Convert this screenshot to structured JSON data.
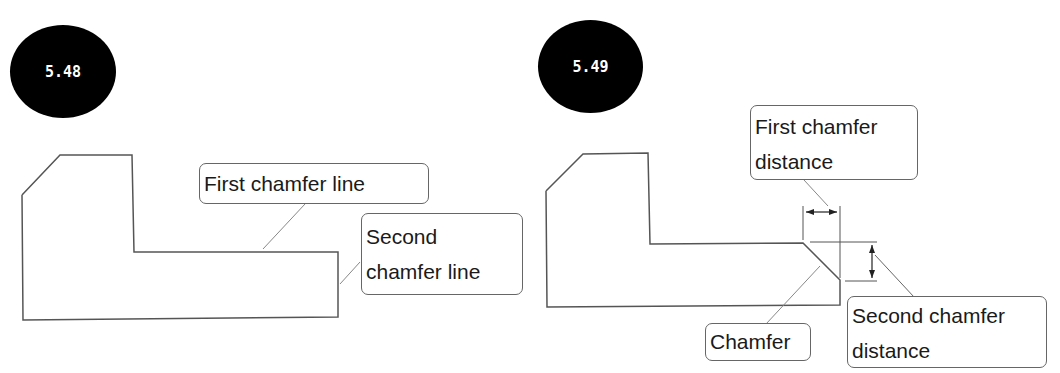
{
  "partial_top_text": "",
  "figures": [
    {
      "number": "5.48",
      "callouts": {
        "first_line": "First chamfer line",
        "second_line_1": "Second",
        "second_line_2": "chamfer line"
      }
    },
    {
      "number": "5.49",
      "callouts": {
        "first_distance_1": "First chamfer",
        "first_distance_2": "distance",
        "chamfer": "Chamfer",
        "second_distance_1": "Second chamfer",
        "second_distance_2": "distance"
      }
    }
  ],
  "colors": {
    "badge": "#000000",
    "outline": "#555555",
    "leader": "#888888"
  }
}
